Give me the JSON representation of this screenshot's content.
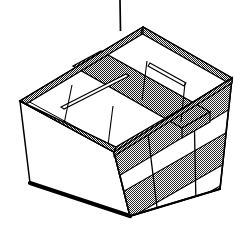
{
  "figure": {
    "title": "Suspended rectangular basket",
    "subject": "basket",
    "style": "line-art technical illustration",
    "background_color": "#ffffff",
    "ink_color": "#000000",
    "texture_fill_color": "#b9b9b9",
    "panel_fill_color": "#ffffff",
    "suspension": {
      "name": "suspension-cable",
      "visible": true,
      "x": 120,
      "y_top": 0,
      "y_bottom": 30,
      "stroke_width": 1.6
    },
    "rim": {
      "name": "basket-rim",
      "texture": "fine-dotted-hatch",
      "thickness": 9,
      "corners": {
        "back": [
          143,
          27
        ],
        "left": [
          20,
          101
        ],
        "right": [
          232,
          78
        ],
        "front": [
          114,
          152
        ]
      }
    },
    "body": {
      "name": "basket-body",
      "left_face_fill": "plain-white",
      "right_face_fill": "horizontal-banded",
      "front_face_fill": "horizontal-banded",
      "band_count": 3,
      "bottom_edge_weight": "heavy",
      "bottom_corners": {
        "left": [
          30,
          183
        ],
        "front": [
          130,
          216
        ],
        "right": [
          220,
          189
        ]
      }
    },
    "compartments": {
      "name": "interior-compartments",
      "count": 4,
      "divider_long": {
        "name": "long-divider",
        "texture": "fine-dotted-hatch"
      },
      "divider_cross": {
        "name": "cross-divider",
        "texture": "thin-rail"
      }
    }
  }
}
